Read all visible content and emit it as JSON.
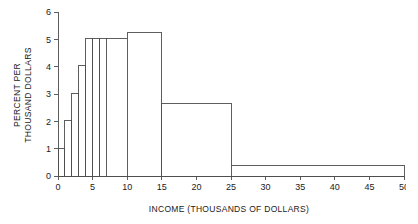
{
  "chart_data": {
    "type": "bar",
    "title": "",
    "subtitle": "",
    "xlabel": "INCOME (THOUSANDS OF DOLLARS)",
    "ylabel": "PERCENT PER THOUSAND DOLLARS",
    "ylabel_line1": "PERCENT PER",
    "ylabel_line2": "THOUSAND DOLLARS",
    "xlim": [
      0,
      50
    ],
    "ylim": [
      0,
      6
    ],
    "grid": false,
    "legend": false,
    "legend_position": "none",
    "bar_fill": "#ffffff",
    "bar_edge": "#4d4d4d",
    "axis_color": "#4d4d4d",
    "background": "#ffffff",
    "xticks": [
      0,
      5,
      10,
      15,
      20,
      25,
      30,
      35,
      40,
      45,
      50
    ],
    "xtick_labels": [
      "0",
      "5",
      "10",
      "15",
      "20",
      "25",
      "30",
      "35",
      "40",
      "45",
      "50"
    ],
    "yticks": [
      0,
      1,
      2,
      3,
      4,
      5,
      6
    ],
    "ytick_labels": [
      "0",
      "1",
      "2",
      "3",
      "4",
      "5",
      "6"
    ],
    "bins": [
      {
        "x0": 0,
        "x1": 1,
        "height": 1.0
      },
      {
        "x0": 1,
        "x1": 2,
        "height": 2.02
      },
      {
        "x0": 2,
        "x1": 3,
        "height": 3.02
      },
      {
        "x0": 3,
        "x1": 4,
        "height": 4.03
      },
      {
        "x0": 4,
        "x1": 5,
        "height": 5.02
      },
      {
        "x0": 5,
        "x1": 6,
        "height": 5.02
      },
      {
        "x0": 6,
        "x1": 7,
        "height": 5.02
      },
      {
        "x0": 7,
        "x1": 10,
        "height": 5.02
      },
      {
        "x0": 10,
        "x1": 15,
        "height": 5.25
      },
      {
        "x0": 15,
        "x1": 25,
        "height": 2.67
      },
      {
        "x0": 25,
        "x1": 50,
        "height": 0.37
      }
    ]
  }
}
